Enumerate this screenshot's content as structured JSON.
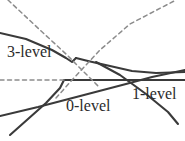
{
  "figure": {
    "background_color": "#ffffff",
    "labels": [
      {
        "id": "3-level",
        "text": "3-level"
      },
      {
        "id": "0-level",
        "text": "0-level"
      },
      {
        "id": "1-level",
        "text": "1-level"
      }
    ]
  },
  "chart_data": {
    "type": "line",
    "title": "",
    "xlabel": "",
    "ylabel": "",
    "xlim": [
      0,
      185
    ],
    "ylim": [
      141,
      0
    ],
    "grid": false,
    "legend_position": "inline-annotations",
    "annotations": [
      {
        "text": "3-level",
        "x": 7,
        "y": 52
      },
      {
        "text": "0-level",
        "x": 66,
        "y": 108
      },
      {
        "text": "1-level",
        "x": 132,
        "y": 96
      }
    ],
    "line_colors": {
      "solid": "#3a3a3a",
      "dashed": "#8c8c8c"
    },
    "series": [
      {
        "name": "3-level branch (upper, solid)",
        "style": "solid",
        "color": "#3a3a3a",
        "width": 2.1,
        "points": [
          [
            0,
            33
          ],
          [
            26,
            39
          ],
          [
            52,
            50
          ],
          [
            66,
            58
          ],
          [
            72,
            62
          ],
          [
            76,
            58
          ]
        ]
      },
      {
        "name": "upper branch continuation to right (solid)",
        "style": "solid",
        "color": "#3a3a3a",
        "width": 2.1,
        "points": [
          [
            76,
            58
          ],
          [
            88,
            61
          ],
          [
            110,
            66
          ],
          [
            132,
            71
          ],
          [
            156,
            73
          ],
          [
            185,
            72
          ]
        ]
      },
      {
        "name": "0-level flat branch (solid)",
        "style": "solid",
        "color": "#3a3a3a",
        "width": 2.1,
        "points": [
          [
            64,
            80
          ],
          [
            96,
            80
          ],
          [
            122,
            80
          ],
          [
            150,
            80
          ],
          [
            185,
            80
          ]
        ]
      },
      {
        "name": "ascending branch low-left to anticrossing (solid)",
        "style": "solid",
        "color": "#3a3a3a",
        "width": 2.1,
        "points": [
          [
            10,
            135
          ],
          [
            28,
            119
          ],
          [
            46,
            103
          ],
          [
            60,
            88
          ],
          [
            64,
            80
          ]
        ]
      },
      {
        "name": "1-level ascending branch (solid)",
        "style": "solid",
        "color": "#3a3a3a",
        "width": 2.1,
        "points": [
          [
            0,
            116
          ],
          [
            38,
            107
          ],
          [
            84,
            95
          ],
          [
            126,
            84
          ],
          [
            152,
            77
          ],
          [
            185,
            70
          ]
        ]
      },
      {
        "name": "descending branch to lower right (solid)",
        "style": "solid",
        "color": "#3a3a3a",
        "width": 2.1,
        "points": [
          [
            96,
            62
          ],
          [
            120,
            75
          ],
          [
            146,
            94
          ],
          [
            168,
            112
          ],
          [
            178,
            124
          ]
        ]
      },
      {
        "name": "diabatic descending (dashed)",
        "style": "dashed",
        "color": "#8c8c8c",
        "width": 1.5,
        "points": [
          [
            8,
            0
          ],
          [
            40,
            30
          ],
          [
            66,
            54
          ],
          [
            86,
            74
          ],
          [
            100,
            88
          ]
        ]
      },
      {
        "name": "diabatic ascending (dashed)",
        "style": "dashed",
        "color": "#8c8c8c",
        "width": 1.5,
        "points": [
          [
            56,
            98
          ],
          [
            72,
            80
          ],
          [
            100,
            50
          ],
          [
            130,
            24
          ],
          [
            176,
            0
          ]
        ]
      },
      {
        "name": "asymptote horizontal (dashed)",
        "style": "dashed",
        "color": "#8c8c8c",
        "width": 1.5,
        "points": [
          [
            0,
            80
          ],
          [
            20,
            80
          ],
          [
            44,
            80
          ],
          [
            64,
            80
          ]
        ]
      }
    ]
  }
}
